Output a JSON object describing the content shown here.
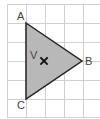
{
  "diagram": {
    "type": "triangle-on-grid",
    "grid": {
      "cell_size": 19,
      "origin_x": 7,
      "origin_y": 4,
      "columns": 5,
      "rows": 6,
      "line_color": "#d0d0d0"
    },
    "triangle": {
      "fill": "#b8b8b8",
      "stroke": "#222222",
      "vertices": [
        {
          "label": "A",
          "x": 26,
          "y": 23
        },
        {
          "label": "B",
          "x": 82,
          "y": 61
        },
        {
          "label": "C",
          "x": 26,
          "y": 99
        }
      ]
    },
    "point": {
      "label": "V",
      "marker": "×",
      "x": 44,
      "y": 61
    }
  }
}
